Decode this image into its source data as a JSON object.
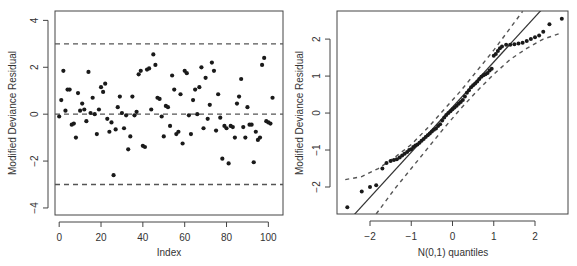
{
  "chart_data": [
    {
      "type": "scatter",
      "title": "",
      "xlabel": "Index",
      "ylabel": "Modified Deviance Residual",
      "xlim": [
        -2,
        107
      ],
      "ylim": [
        -4.3,
        4.4
      ],
      "xticks": [
        0,
        20,
        40,
        60,
        80,
        100
      ],
      "yticks": [
        -4,
        -2,
        0,
        2,
        4
      ],
      "grid": false,
      "hlines": [
        {
          "y": 3,
          "style": "dashed"
        },
        {
          "y": 0,
          "style": "dashed"
        },
        {
          "y": -3,
          "style": "dashed"
        }
      ],
      "x": [
        0,
        1,
        2,
        3,
        4,
        5,
        6,
        7,
        8,
        9,
        10,
        11,
        12,
        13,
        14,
        15,
        16,
        17,
        18,
        19,
        20,
        21,
        22,
        23,
        24,
        25,
        26,
        27,
        28,
        29,
        30,
        31,
        32,
        33,
        34,
        35,
        36,
        37,
        38,
        39,
        40,
        41,
        42,
        43,
        44,
        45,
        46,
        47,
        48,
        49,
        50,
        51,
        52,
        53,
        54,
        55,
        56,
        57,
        58,
        59,
        60,
        61,
        62,
        63,
        64,
        65,
        66,
        67,
        68,
        69,
        70,
        71,
        72,
        73,
        74,
        75,
        76,
        77,
        78,
        79,
        80,
        81,
        82,
        83,
        84,
        85,
        86,
        87,
        88,
        89,
        90,
        91,
        92,
        93,
        94,
        95,
        96,
        97,
        98,
        99,
        100,
        101,
        102
      ],
      "y": [
        -0.1,
        0.6,
        1.85,
        0.15,
        1.05,
        1.05,
        -0.45,
        -0.4,
        -1.0,
        0.9,
        0.15,
        0.45,
        0.2,
        -0.3,
        1.8,
        0.05,
        0.7,
        0.0,
        -0.85,
        0.2,
        1.15,
        0.95,
        1.3,
        -0.2,
        -0.75,
        -0.35,
        -2.6,
        -0.65,
        0.3,
        0.75,
        0.05,
        -0.6,
        -0.05,
        -1.5,
        -0.95,
        0.75,
        -0.05,
        0.1,
        1.7,
        1.85,
        -1.35,
        -1.4,
        1.9,
        1.95,
        0.2,
        2.55,
        2.1,
        0.7,
        0.65,
        -0.1,
        -0.95,
        0.35,
        0.3,
        -0.5,
        1.65,
        1.05,
        -0.85,
        -0.75,
        0.85,
        -1.25,
        1.85,
        1.75,
        -0.05,
        -0.85,
        0.6,
        1.05,
        0.0,
        1.15,
        2.0,
        -0.6,
        1.55,
        -0.2,
        0.4,
        2.2,
        1.85,
        -0.7,
        0.85,
        -0.15,
        -1.9,
        -0.5,
        -0.6,
        -2.1,
        -0.5,
        -0.55,
        -1.0,
        0.45,
        0.75,
        1.5,
        -0.55,
        -1.0,
        0.3,
        -0.45,
        -0.45,
        -2.05,
        -0.75,
        -1.1,
        -1.0,
        2.1,
        2.4,
        -0.3,
        -0.35,
        -0.4,
        0.7,
        -0.65,
        -0.55,
        1.0
      ]
    },
    {
      "type": "scatter",
      "subtype": "qq-plot",
      "title": "",
      "xlabel": "N(0,1) quantiles",
      "ylabel": "Modified Deviance Residual",
      "xlim": [
        -2.8,
        2.8
      ],
      "ylim": [
        -2.73,
        2.76
      ],
      "xticks": [
        -2,
        -1,
        0,
        1,
        2
      ],
      "yticks": [
        -2,
        -1,
        0,
        1,
        2
      ],
      "grid": false,
      "reference_line": {
        "slope": 1.22,
        "intercept": 0.16,
        "style": "solid"
      },
      "envelope": {
        "style": "dashed",
        "upper": [
          [
            -2.6,
            -1.8
          ],
          [
            -2.2,
            -1.72
          ],
          [
            -1.8,
            -1.5
          ],
          [
            -1.4,
            -1.2
          ],
          [
            -1.0,
            -0.85
          ],
          [
            -0.6,
            -0.4
          ],
          [
            -0.2,
            0.1
          ],
          [
            0.2,
            0.6
          ],
          [
            0.6,
            1.15
          ],
          [
            1.0,
            1.7
          ],
          [
            1.4,
            2.3
          ],
          [
            1.7,
            2.75
          ]
        ],
        "lower": [
          [
            -1.85,
            -2.73
          ],
          [
            -1.4,
            -2.05
          ],
          [
            -1.0,
            -1.5
          ],
          [
            -0.6,
            -0.95
          ],
          [
            -0.2,
            -0.4
          ],
          [
            0.2,
            0.12
          ],
          [
            0.6,
            0.6
          ],
          [
            1.0,
            1.05
          ],
          [
            1.4,
            1.45
          ],
          [
            1.8,
            1.75
          ],
          [
            2.2,
            2.0
          ],
          [
            2.6,
            2.15
          ]
        ]
      },
      "points": [
        [
          -2.55,
          -2.55
        ],
        [
          -2.2,
          -2.12
        ],
        [
          -2.0,
          -2.0
        ],
        [
          -1.85,
          -1.95
        ],
        [
          -1.7,
          -1.5
        ],
        [
          -1.6,
          -1.35
        ],
        [
          -1.5,
          -1.3
        ],
        [
          -1.42,
          -1.27
        ],
        [
          -1.35,
          -1.25
        ],
        [
          -1.28,
          -1.2
        ],
        [
          -1.22,
          -1.15
        ],
        [
          -1.16,
          -1.1
        ],
        [
          -1.1,
          -1.05
        ],
        [
          -1.05,
          -1.0
        ],
        [
          -1.0,
          -0.98
        ],
        [
          -0.95,
          -0.92
        ],
        [
          -0.9,
          -0.88
        ],
        [
          -0.85,
          -0.85
        ],
        [
          -0.8,
          -0.8
        ],
        [
          -0.75,
          -0.75
        ],
        [
          -0.7,
          -0.7
        ],
        [
          -0.65,
          -0.65
        ],
        [
          -0.6,
          -0.6
        ],
        [
          -0.55,
          -0.55
        ],
        [
          -0.5,
          -0.5
        ],
        [
          -0.45,
          -0.45
        ],
        [
          -0.4,
          -0.42
        ],
        [
          -0.35,
          -0.35
        ],
        [
          -0.3,
          -0.3
        ],
        [
          -0.25,
          -0.2
        ],
        [
          -0.2,
          -0.12
        ],
        [
          -0.15,
          -0.05
        ],
        [
          -0.1,
          0.0
        ],
        [
          -0.05,
          0.05
        ],
        [
          0.0,
          0.1
        ],
        [
          0.05,
          0.15
        ],
        [
          0.1,
          0.2
        ],
        [
          0.15,
          0.25
        ],
        [
          0.2,
          0.3
        ],
        [
          0.25,
          0.35
        ],
        [
          0.3,
          0.45
        ],
        [
          0.35,
          0.55
        ],
        [
          0.4,
          0.62
        ],
        [
          0.45,
          0.7
        ],
        [
          0.5,
          0.75
        ],
        [
          0.55,
          0.8
        ],
        [
          0.6,
          0.85
        ],
        [
          0.65,
          0.92
        ],
        [
          0.7,
          0.98
        ],
        [
          0.75,
          1.02
        ],
        [
          0.8,
          1.05
        ],
        [
          0.85,
          1.08
        ],
        [
          0.9,
          1.15
        ],
        [
          0.95,
          1.2
        ],
        [
          1.0,
          1.55
        ],
        [
          1.05,
          1.6
        ],
        [
          1.1,
          1.68
        ],
        [
          1.15,
          1.75
        ],
        [
          1.2,
          1.8
        ],
        [
          1.3,
          1.85
        ],
        [
          1.4,
          1.85
        ],
        [
          1.5,
          1.86
        ],
        [
          1.6,
          1.88
        ],
        [
          1.7,
          1.9
        ],
        [
          1.8,
          1.95
        ],
        [
          1.9,
          2.0
        ],
        [
          2.0,
          2.05
        ],
        [
          2.1,
          2.1
        ],
        [
          2.2,
          2.2
        ],
        [
          2.35,
          2.4
        ],
        [
          2.65,
          2.55
        ]
      ]
    }
  ],
  "labels": {
    "left_xlabel": "Index",
    "left_ylabel": "Modified Deviance Residual",
    "right_xlabel": "N(0,1) quantiles",
    "right_ylabel": "Modified Deviance Residual"
  }
}
